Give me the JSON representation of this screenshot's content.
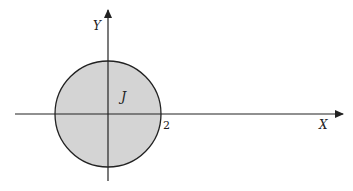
{
  "diagram": {
    "type": "coordinate-region",
    "x_axis_label": "X",
    "y_axis_label": "Y",
    "region_label": "J",
    "radius_tick_label": "2",
    "region_shape": "disk centered at origin with radius 2",
    "colors": {
      "fill": "#d4d4d4",
      "stroke": "#222222",
      "axis": "#222222"
    }
  }
}
